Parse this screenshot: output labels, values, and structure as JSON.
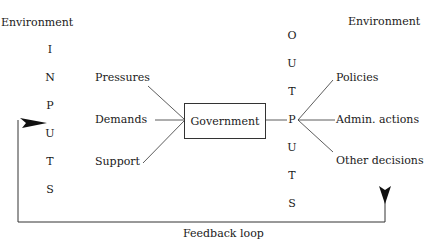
{
  "diagram": {
    "left_environment": "Environment",
    "right_environment": "Environment",
    "inputs_letters": [
      "I",
      "N",
      "P",
      "U",
      "T",
      "S"
    ],
    "outputs_letters": [
      "O",
      "U",
      "T",
      "P",
      "U",
      "T",
      "S"
    ],
    "inputs": [
      "Pressures",
      "Demands",
      "Support"
    ],
    "center": "Government",
    "outputs": [
      "Policies",
      "Admin. actions",
      "Other decisions"
    ],
    "feedback": "Feedback loop"
  },
  "colors": {
    "line": "#333333",
    "text": "#1a1a1a",
    "background": "#ffffff"
  }
}
